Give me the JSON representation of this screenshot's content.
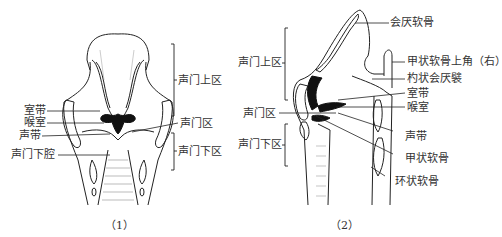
{
  "figure1": {
    "caption": "（1）",
    "labels": {
      "ventricular_fold": "室带",
      "laryngeal_ventricle": "喉室",
      "vocal_fold": "声带",
      "infraglottic_cavity": "声门下腔",
      "supraglottic": "声门上区",
      "glottic": "声门区",
      "subglottic": "声门下区"
    }
  },
  "figure2": {
    "caption": "（2）",
    "labels": {
      "supraglottic": "声门上区",
      "glottic": "声门区",
      "subglottic": "声门下区",
      "epiglottic_cartilage": "会厌软骨",
      "thyroid_superior_horn": "甲状软骨上角（右）",
      "aryepiglottic_fold": "杓状会厌襞",
      "ventricular_fold": "室带",
      "laryngeal_ventricle": "喉室",
      "vocal_fold": "声带",
      "thyroid_cartilage": "甲状软骨",
      "cricoid_cartilage": "环状软骨"
    }
  }
}
